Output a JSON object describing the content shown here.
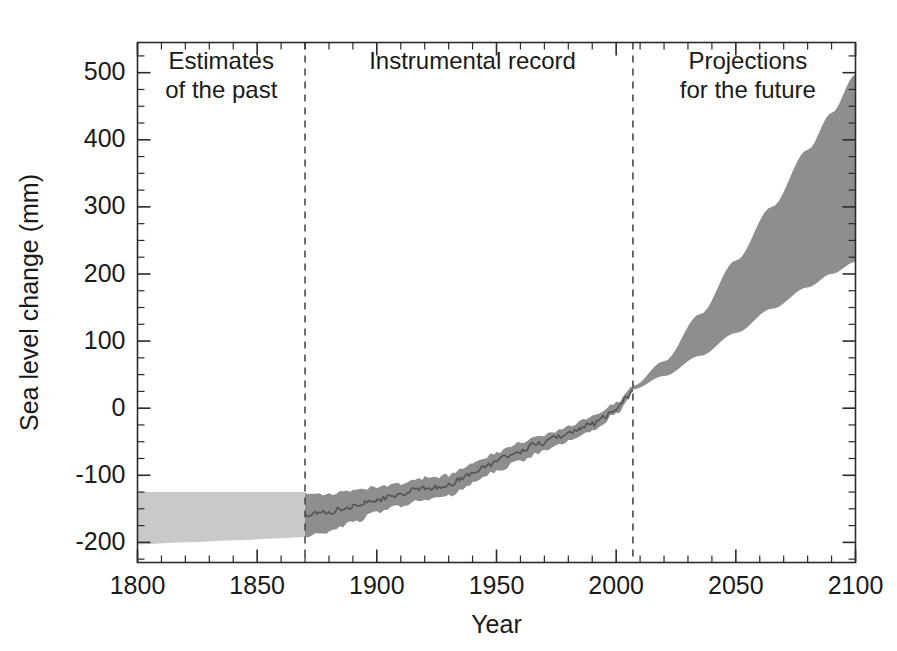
{
  "chart_data": {
    "type": "area",
    "title": "",
    "xlabel": "Year",
    "ylabel": "Sea level change (mm)",
    "xlim": [
      1800,
      2100
    ],
    "ylim": [
      -230,
      545
    ],
    "grid": false,
    "legend_position": "none",
    "x_ticks_major": [
      1800,
      1850,
      1900,
      1950,
      2000,
      2050,
      2100
    ],
    "x_tick_labels": [
      "1800",
      "1850",
      "1900",
      "1950",
      "2000",
      "2050",
      "2100"
    ],
    "x_minor_step": 10,
    "y_ticks_major": [
      -200,
      -100,
      0,
      100,
      200,
      300,
      400,
      500
    ],
    "y_tick_labels": [
      "-200",
      "-100",
      "0",
      "100",
      "200",
      "300",
      "400",
      "500"
    ],
    "y_minor_step": 25,
    "annotations": [
      {
        "name": "estimates-of-the-past",
        "lines": [
          "Estimates",
          "of the past"
        ],
        "x": 1835,
        "y": 505
      },
      {
        "name": "instrumental-record",
        "lines": [
          "Instrumental record"
        ],
        "x": 1940,
        "y": 505
      },
      {
        "name": "projections-for-the-future",
        "lines": [
          "Projections",
          "for the future"
        ],
        "x": 2055,
        "y": 505
      }
    ],
    "dividers": [
      {
        "name": "past-to-instrumental",
        "x": 1870,
        "style": "dashed"
      },
      {
        "name": "instrumental-to-projection",
        "x": 2007,
        "style": "dashed"
      }
    ],
    "series": [
      {
        "name": "Estimates of the past (uncertainty band)",
        "kind": "band",
        "color": "#c9c9c9",
        "x": [
          1800,
          1820,
          1840,
          1860,
          1870
        ],
        "upper": [
          -125,
          -125,
          -125,
          -125,
          -125
        ],
        "lower": [
          -203,
          -200,
          -197,
          -194,
          -192
        ]
      },
      {
        "name": "Instrumental record (uncertainty band)",
        "kind": "band",
        "color": "#8e8e8e",
        "x": [
          1870,
          1880,
          1890,
          1900,
          1910,
          1920,
          1930,
          1940,
          1950,
          1960,
          1970,
          1980,
          1990,
          2000,
          2007
        ],
        "upper": [
          -125,
          -128,
          -124,
          -118,
          -113,
          -104,
          -100,
          -82,
          -66,
          -52,
          -40,
          -27,
          -13,
          8,
          32
        ],
        "lower": [
          -192,
          -184,
          -170,
          -156,
          -145,
          -137,
          -131,
          -112,
          -94,
          -78,
          -64,
          -50,
          -35,
          -9,
          24
        ]
      },
      {
        "name": "Instrumental record (central estimate)",
        "kind": "line",
        "color": "#565656",
        "x": [
          1870,
          1875,
          1880,
          1885,
          1890,
          1895,
          1900,
          1905,
          1910,
          1915,
          1920,
          1925,
          1930,
          1935,
          1940,
          1945,
          1950,
          1955,
          1960,
          1965,
          1970,
          1975,
          1980,
          1985,
          1990,
          1995,
          2000,
          2005,
          2007
        ],
        "y": [
          -160,
          -157,
          -156,
          -150,
          -147,
          -140,
          -138,
          -132,
          -129,
          -121,
          -120,
          -117,
          -115,
          -105,
          -97,
          -88,
          -80,
          -70,
          -65,
          -55,
          -52,
          -42,
          -38,
          -29,
          -24,
          -13,
          -2,
          18,
          28
        ]
      },
      {
        "name": "Projections for the future (range)",
        "kind": "band",
        "color": "#8e8e8e",
        "x": [
          2007,
          2020,
          2035,
          2050,
          2065,
          2080,
          2090,
          2100
        ],
        "upper": [
          33,
          70,
          140,
          220,
          300,
          385,
          440,
          497
        ],
        "lower": [
          28,
          48,
          78,
          112,
          148,
          180,
          200,
          218
        ]
      }
    ]
  },
  "axes": {
    "ylabel": "Sea level change (mm)",
    "xlabel": "Year"
  }
}
